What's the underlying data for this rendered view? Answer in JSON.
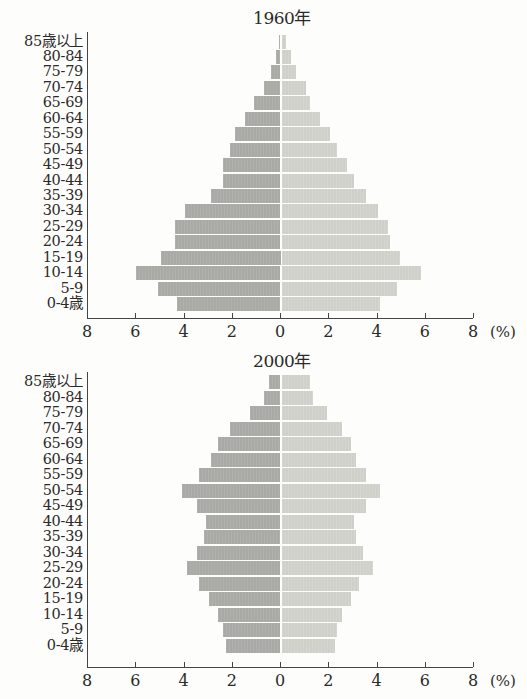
{
  "axis": {
    "tick_labels": [
      "8",
      "6",
      "4",
      "2",
      "0",
      "2",
      "4",
      "6",
      "8"
    ],
    "unit": "(%)"
  },
  "age_groups": [
    "85歳以上",
    "80-84",
    "75-79",
    "70-74",
    "65-69",
    "60-64",
    "55-59",
    "50-54",
    "45-49",
    "40-44",
    "35-39",
    "30-34",
    "25-29",
    "20-24",
    "15-19",
    "10-14",
    "5-9",
    "0-4歳"
  ],
  "colors": {
    "male_bar": "#a9a9a5",
    "female_bar": "#d0d0cb",
    "axis": "#444444"
  },
  "chart_data": [
    {
      "type": "bar",
      "subtype": "population_pyramid",
      "title": "1960年",
      "categories": [
        "85歳以上",
        "80-84",
        "75-79",
        "70-74",
        "65-69",
        "60-64",
        "55-59",
        "50-54",
        "45-49",
        "40-44",
        "35-39",
        "30-34",
        "25-29",
        "20-24",
        "15-19",
        "10-14",
        "5-9",
        "0-4歳"
      ],
      "series": [
        {
          "name": "left (darker)",
          "side": "left",
          "values": [
            0.1,
            0.2,
            0.4,
            0.7,
            1.1,
            1.5,
            1.9,
            2.1,
            2.4,
            2.4,
            2.9,
            4.0,
            4.4,
            4.4,
            5.0,
            6.0,
            5.1,
            4.3
          ]
        },
        {
          "name": "right (lighter)",
          "side": "right",
          "values": [
            0.2,
            0.4,
            0.6,
            1.0,
            1.2,
            1.6,
            2.0,
            2.3,
            2.7,
            3.0,
            3.5,
            4.0,
            4.4,
            4.5,
            4.9,
            5.8,
            4.8,
            4.1
          ]
        }
      ],
      "xlabel": "(%)",
      "xlim": [
        -8,
        8
      ],
      "xticks": [
        8,
        6,
        4,
        2,
        0,
        2,
        4,
        6,
        8
      ],
      "grid": false
    },
    {
      "type": "bar",
      "subtype": "population_pyramid",
      "title": "2000年",
      "categories": [
        "85歳以上",
        "80-84",
        "75-79",
        "70-74",
        "65-69",
        "60-64",
        "55-59",
        "50-54",
        "45-49",
        "40-44",
        "35-39",
        "30-34",
        "25-29",
        "20-24",
        "15-19",
        "10-14",
        "5-9",
        "0-4歳"
      ],
      "series": [
        {
          "name": "left (darker)",
          "side": "left",
          "values": [
            0.5,
            0.7,
            1.3,
            2.1,
            2.6,
            2.9,
            3.4,
            4.1,
            3.5,
            3.1,
            3.2,
            3.5,
            3.9,
            3.4,
            3.0,
            2.6,
            2.4,
            2.3
          ]
        },
        {
          "name": "right (lighter)",
          "side": "right",
          "values": [
            1.2,
            1.3,
            1.9,
            2.5,
            2.9,
            3.1,
            3.5,
            4.1,
            3.5,
            3.0,
            3.1,
            3.4,
            3.8,
            3.2,
            2.9,
            2.5,
            2.3,
            2.2
          ]
        }
      ],
      "xlabel": "(%)",
      "xlim": [
        -8,
        8
      ],
      "xticks": [
        8,
        6,
        4,
        2,
        0,
        2,
        4,
        6,
        8
      ],
      "grid": false
    }
  ]
}
